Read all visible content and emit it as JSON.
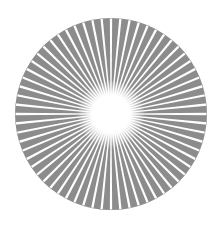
{
  "image": {
    "subject": "starburst-icon",
    "colors": {
      "disc": "#8c8c8c",
      "rays": "#ffffff",
      "center": "#ffffff",
      "background": "#ffffff"
    },
    "geometry": {
      "cx": 111,
      "cy": 114,
      "radius": 96,
      "ray_count": 64,
      "center_radius": 22
    }
  }
}
